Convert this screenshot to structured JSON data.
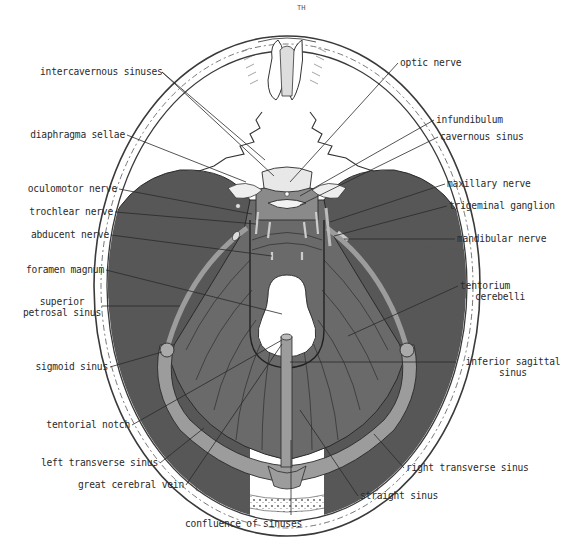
{
  "figure": {
    "page_mark": "TH",
    "colors": {
      "background": "#ffffff",
      "skull_line": "#3a3a3a",
      "dura_dark": "#555555",
      "tentorium": "#6b6b6b",
      "sinus": "#9a9a9a",
      "foramen": "#ffffff",
      "text": "#2a2a2a"
    }
  },
  "labels": {
    "left": [
      {
        "id": "intercavernous-sinuses",
        "text": "intercavernous sinuses"
      },
      {
        "id": "diaphragma-sellae",
        "text": "diaphragma sellae"
      },
      {
        "id": "oculomotor-nerve",
        "text": "oculomotor nerve"
      },
      {
        "id": "trochlear-nerve",
        "text": "trochlear nerve"
      },
      {
        "id": "abducent-nerve",
        "text": "abducent nerve"
      },
      {
        "id": "foramen-magnum",
        "text": "foramen magnum"
      },
      {
        "id": "superior-petrosal-sinus",
        "line1": "superior",
        "line2": "petrosal sinus"
      },
      {
        "id": "sigmoid-sinus",
        "text": "sigmoid sinus"
      },
      {
        "id": "tentorial-notch",
        "text": "tentorial notch"
      },
      {
        "id": "left-transverse-sinus",
        "text": "left transverse sinus"
      },
      {
        "id": "great-cerebral-vein",
        "text": "great cerebral vein"
      }
    ],
    "right": [
      {
        "id": "optic-nerve",
        "text": "optic nerve"
      },
      {
        "id": "infundibulum",
        "text": "infundibulum"
      },
      {
        "id": "cavernous-sinus",
        "text": "cavernous sinus"
      },
      {
        "id": "maxillary-nerve",
        "text": "maxillary nerve"
      },
      {
        "id": "trigeminal-ganglion",
        "text": "trigeminal ganglion"
      },
      {
        "id": "mandibular-nerve",
        "text": "mandibular nerve"
      },
      {
        "id": "tentorium-cerebelli",
        "line1": "tentorium",
        "line2": "cerebelli"
      },
      {
        "id": "inferior-sagittal-sinus",
        "line1": "inferior sagittal",
        "line2": "sinus"
      },
      {
        "id": "right-transverse-sinus",
        "text": "right transverse sinus"
      },
      {
        "id": "straight-sinus",
        "text": "straight sinus"
      }
    ],
    "bottom": [
      {
        "id": "confluence-of-sinuses",
        "text": "confluence of sinuses"
      }
    ]
  }
}
